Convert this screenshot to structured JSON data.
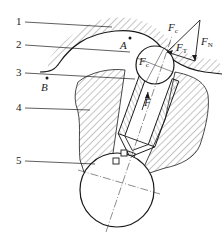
{
  "diagram": {
    "type": "mechanical cross-section (ball-plunger against cam track)",
    "part_labels": [
      {
        "id": "1",
        "text": "1"
      },
      {
        "id": "2",
        "text": "2"
      },
      {
        "id": "3",
        "text": "3"
      },
      {
        "id": "4",
        "text": "4"
      },
      {
        "id": "5",
        "text": "5"
      }
    ],
    "point_labels": {
      "A": "A",
      "B": "B"
    },
    "force_labels": {
      "Fc_outer": {
        "main": "F",
        "sub": "c"
      },
      "FT": {
        "main": "F",
        "sub": "T"
      },
      "FN": {
        "main": "F",
        "sub": "N"
      },
      "Fc_inner": {
        "main": "F",
        "sub": "c"
      },
      "F": {
        "main": "F",
        "sub": ""
      }
    },
    "colors": {
      "line": "#1a1a1a",
      "hatch": "#555555",
      "background": "#ffffff"
    }
  }
}
